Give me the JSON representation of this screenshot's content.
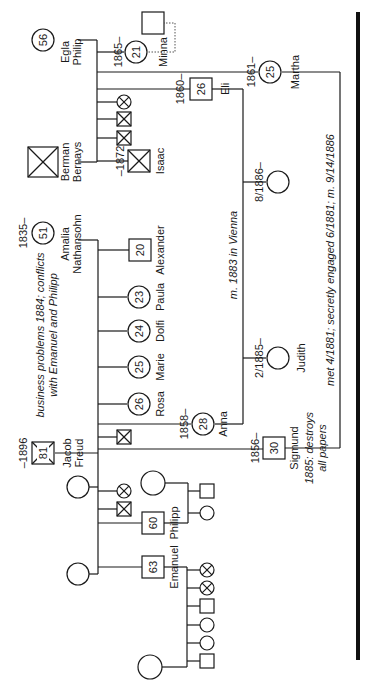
{
  "colors": {
    "ink": "#1a1a1a",
    "background": "#ffffff"
  },
  "people": [
    {
      "id": "egla",
      "name": "Egla Philip",
      "label_lines": [
        "Egla",
        "Philip"
      ],
      "sex": "female",
      "age": "56",
      "x": 43,
      "y": 40,
      "deceased": false
    },
    {
      "id": "berman",
      "name": "Berman Bernays",
      "label_lines": [
        "Berman",
        "Bernays"
      ],
      "sex": "male",
      "age": "",
      "x": 43,
      "y": 162,
      "deceased": true
    },
    {
      "id": "minna",
      "name": "Minna",
      "label_lines": [
        "Minna"
      ],
      "sex": "female",
      "age": "21",
      "dates": "1865–",
      "x": 136,
      "y": 52,
      "deceased": false
    },
    {
      "id": "minna_partner",
      "name": "",
      "label_lines": [],
      "sex": "male",
      "age": "",
      "x": 153,
      "y": 23,
      "deceased": false
    },
    {
      "id": "martha",
      "name": "Martha",
      "label_lines": [
        "Martha"
      ],
      "sex": "female",
      "age": "25",
      "dates": "1861–",
      "x": 270,
      "y": 72,
      "deceased": false
    },
    {
      "id": "eli",
      "name": "Eli",
      "label_lines": [
        "Eli"
      ],
      "sex": "male",
      "age": "26",
      "dates": "1860–",
      "x": 201,
      "y": 89,
      "deceased": false
    },
    {
      "id": "bernays_child_1",
      "name": "",
      "label_lines": [],
      "sex": "female",
      "age": "",
      "x": 124,
      "y": 102,
      "deceased": true,
      "small": true
    },
    {
      "id": "bernays_child_2",
      "name": "",
      "label_lines": [],
      "sex": "male",
      "age": "",
      "x": 124,
      "y": 119,
      "deceased": true,
      "small": true
    },
    {
      "id": "bernays_child_3",
      "name": "",
      "label_lines": [],
      "sex": "male",
      "age": "",
      "x": 124,
      "y": 138,
      "deceased": true,
      "small": true
    },
    {
      "id": "isaac",
      "name": "Isaac",
      "label_lines": [
        "Isaac"
      ],
      "sex": "male",
      "age": "",
      "dates": "–1872",
      "x": 139,
      "y": 161,
      "deceased": true
    },
    {
      "id": "eli_child",
      "name": "",
      "label_lines": [],
      "sex": "female",
      "age": "",
      "dates": "8/1886–",
      "x": 278,
      "y": 182,
      "deceased": false
    },
    {
      "id": "amalia",
      "name": "Amalia Nathansohn",
      "label_lines": [
        "Amalia",
        "Nathansohn"
      ],
      "sex": "female",
      "age": "51",
      "dates": "1835–",
      "x": 43,
      "y": 233,
      "deceased": false
    },
    {
      "id": "alexander",
      "name": "Alexander",
      "label_lines": [
        "Alexander"
      ],
      "sex": "male",
      "age": "20",
      "x": 140,
      "y": 250,
      "deceased": false
    },
    {
      "id": "paula",
      "name": "Paula",
      "label_lines": [
        "Paula"
      ],
      "sex": "female",
      "age": "23",
      "x": 139,
      "y": 297,
      "deceased": false
    },
    {
      "id": "dolfi",
      "name": "Dolfi",
      "label_lines": [
        "Dolfi"
      ],
      "sex": "female",
      "age": "24",
      "x": 139,
      "y": 331,
      "deceased": false
    },
    {
      "id": "marie",
      "name": "Marie",
      "label_lines": [
        "Marie"
      ],
      "sex": "female",
      "age": "25",
      "x": 139,
      "y": 367,
      "deceased": false
    },
    {
      "id": "rosa",
      "name": "Rosa",
      "label_lines": [
        "Rosa"
      ],
      "sex": "female",
      "age": "26",
      "x": 139,
      "y": 404,
      "deceased": false
    },
    {
      "id": "judith",
      "name": "Judith",
      "label_lines": [
        "Judith"
      ],
      "sex": "female",
      "age": "",
      "dates": "2/1885–",
      "x": 278,
      "y": 358,
      "deceased": false
    },
    {
      "id": "anna",
      "name": "Anna",
      "label_lines": [
        "Anna"
      ],
      "sex": "female",
      "age": "28",
      "dates": "1858–",
      "x": 203,
      "y": 424,
      "deceased": false
    },
    {
      "id": "freud_child_dead",
      "name": "",
      "label_lines": [],
      "sex": "male",
      "age": "",
      "x": 124,
      "y": 437,
      "deceased": true,
      "small": true
    },
    {
      "id": "jacob",
      "name": "Jacob Freud",
      "label_lines": [
        "Jacob",
        "Freud"
      ],
      "sex": "male",
      "age": "81",
      "dates": "–1896",
      "x": 43,
      "y": 453,
      "deceased": true
    },
    {
      "id": "sigmund",
      "name": "Sigmund",
      "label_lines": [
        "Sigmund"
      ],
      "sex": "male",
      "age": "30",
      "dates": "1856–",
      "x": 274,
      "y": 448,
      "deceased": false
    },
    {
      "id": "jacob_wife_1",
      "name": "",
      "label_lines": [],
      "sex": "female",
      "age": "",
      "x": 78,
      "y": 487,
      "deceased": false
    },
    {
      "id": "jacob_child_a",
      "name": "",
      "label_lines": [],
      "sex": "female",
      "age": "",
      "x": 124,
      "y": 491,
      "deceased": true,
      "small": true
    },
    {
      "id": "jacob_child_b",
      "name": "",
      "label_lines": [],
      "sex": "male",
      "age": "",
      "x": 124,
      "y": 509,
      "deceased": true,
      "small": true
    },
    {
      "id": "philipp",
      "name": "Philipp",
      "label_lines": [
        "Philipp"
      ],
      "sex": "male",
      "age": "60",
      "x": 153,
      "y": 523,
      "deceased": false
    },
    {
      "id": "philipp_wife",
      "name": "",
      "label_lines": [],
      "sex": "female",
      "age": "",
      "x": 153,
      "y": 483,
      "deceased": false,
      "large": true
    },
    {
      "id": "philipp_child_1",
      "name": "",
      "label_lines": [],
      "sex": "male",
      "age": "",
      "x": 207,
      "y": 491,
      "deceased": false,
      "small": true
    },
    {
      "id": "philipp_child_2",
      "name": "",
      "label_lines": [],
      "sex": "female",
      "age": "",
      "x": 207,
      "y": 513,
      "deceased": false,
      "small": true
    },
    {
      "id": "jacob_wife_2",
      "name": "",
      "label_lines": [],
      "sex": "female",
      "age": "",
      "x": 78,
      "y": 574,
      "deceased": false
    },
    {
      "id": "emanuel",
      "name": "Emanuel",
      "label_lines": [
        "Emanuel"
      ],
      "sex": "male",
      "age": "63",
      "x": 153,
      "y": 567,
      "deceased": false
    },
    {
      "id": "emanuel_wife",
      "name": "",
      "label_lines": [],
      "sex": "female",
      "age": "",
      "x": 150,
      "y": 667,
      "deceased": false,
      "large": true
    },
    {
      "id": "emanuel_child_1",
      "name": "",
      "label_lines": [],
      "sex": "female",
      "age": "",
      "x": 207,
      "y": 570,
      "deceased": true,
      "small": true
    },
    {
      "id": "emanuel_child_2",
      "name": "",
      "label_lines": [],
      "sex": "female",
      "age": "",
      "x": 207,
      "y": 588,
      "deceased": true,
      "small": true
    },
    {
      "id": "emanuel_child_3",
      "name": "",
      "label_lines": [],
      "sex": "male",
      "age": "",
      "x": 207,
      "y": 606,
      "deceased": false,
      "small": true
    },
    {
      "id": "emanuel_child_4",
      "name": "",
      "label_lines": [],
      "sex": "female",
      "age": "",
      "x": 207,
      "y": 625,
      "deceased": false,
      "small": true
    },
    {
      "id": "emanuel_child_5",
      "name": "",
      "label_lines": [],
      "sex": "female",
      "age": "",
      "x": 207,
      "y": 643,
      "deceased": false,
      "small": true
    },
    {
      "id": "emanuel_child_6",
      "name": "",
      "label_lines": [],
      "sex": "male",
      "age": "",
      "x": 207,
      "y": 661,
      "deceased": false,
      "small": true
    }
  ],
  "annotations": {
    "jacob_note": [
      "business problems 1884; conflicts",
      "with Emanuel and Philipp"
    ],
    "eli_anna_marriage": "m. 1883 in Vienna",
    "sigmund_martha_relationship": "met 4/1881; secretly engaged 6/1881; m. 9/14/1886",
    "sigmund_note": [
      "1885: destroys",
      "all papers"
    ]
  },
  "date_labels": {
    "minna": "1865–",
    "martha": "1861–",
    "eli": "1860–",
    "isaac": "–1872",
    "eli_child": "8/1886–",
    "amalia": "1835–",
    "judith": "2/1885–",
    "anna": "1858–",
    "jacob": "–1896",
    "sigmund": "1856–"
  }
}
